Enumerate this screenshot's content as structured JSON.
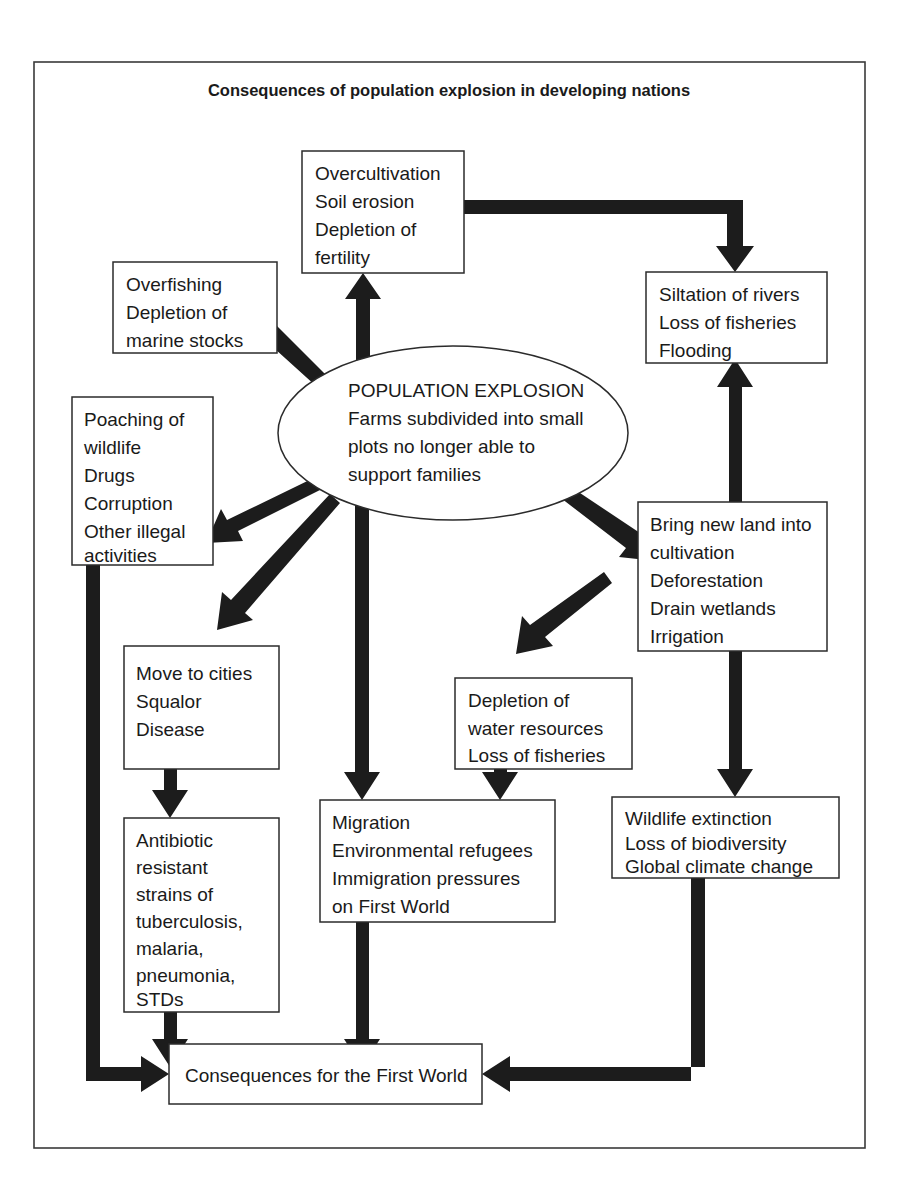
{
  "diagram": {
    "title": "Consequences of population explosion in developing nations",
    "center": {
      "id": "population-explosion",
      "lines": [
        "POPULATION EXPLOSION",
        "Farms subdivided into small",
        "plots no longer able to",
        "support families"
      ]
    },
    "nodes": [
      {
        "id": "overcultivation",
        "lines": [
          "Overcultivation",
          "Soil erosion",
          "Depletion of",
          "fertility"
        ]
      },
      {
        "id": "siltation",
        "lines": [
          "Siltation of rivers",
          "Loss of fisheries",
          "Flooding"
        ]
      },
      {
        "id": "overfishing",
        "lines": [
          "Overfishing",
          "Depletion of",
          "marine stocks"
        ]
      },
      {
        "id": "poaching",
        "lines": [
          "Poaching of",
          "wildlife",
          "Drugs",
          "Corruption",
          "Other illegal",
          "activities"
        ]
      },
      {
        "id": "new-land",
        "lines": [
          "Bring new land into",
          "cultivation",
          "Deforestation",
          "Drain wetlands",
          "Irrigation"
        ]
      },
      {
        "id": "move-to-cities",
        "lines": [
          "Move to cities",
          "Squalor",
          "Disease"
        ]
      },
      {
        "id": "water-depletion",
        "lines": [
          "Depletion of",
          "water resources",
          "Loss of fisheries"
        ]
      },
      {
        "id": "antibiotic-resistance",
        "lines": [
          "Antibiotic",
          "resistant",
          "strains of",
          "tuberculosis,",
          "malaria,",
          "pneumonia,",
          "STDs"
        ]
      },
      {
        "id": "migration",
        "lines": [
          "Migration",
          "Environmental refugees",
          "Immigration pressures",
          "on First World"
        ]
      },
      {
        "id": "wildlife-extinction",
        "lines": [
          "Wildlife extinction",
          "Loss of biodiversity",
          "Global climate change"
        ]
      },
      {
        "id": "first-world",
        "lines": [
          "Consequences for the First World"
        ]
      }
    ],
    "colors": {
      "arrow": "#1c1c1c",
      "box_stroke": "#2b2b2b",
      "frame_stroke": "#3a3a3a",
      "background": "#ffffff",
      "text": "#1a1a1a"
    }
  }
}
